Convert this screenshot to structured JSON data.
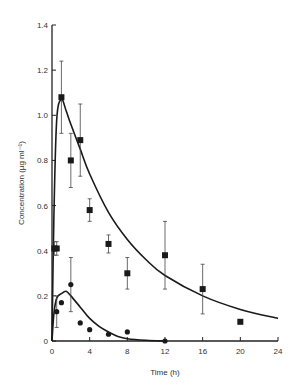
{
  "chart_data": {
    "type": "scatter",
    "title": "",
    "xlabel": "Time (h)",
    "ylabel": "Concentration (µg ml⁻¹)",
    "xlim": [
      0,
      24
    ],
    "ylim": [
      0,
      1.4
    ],
    "xticks": [
      0,
      4,
      8,
      12,
      16,
      20,
      24
    ],
    "yticks": [
      0,
      0.2,
      0.4,
      0.6,
      0.8,
      1.0,
      1.2,
      1.4
    ],
    "xtick_labels": [
      "0",
      "4",
      "8",
      "12",
      "16",
      "20",
      "24"
    ],
    "ytick_labels": [
      "0",
      "0.2",
      "0.4",
      "0.6",
      "0.8",
      "1.0",
      "1.2",
      "1.4"
    ],
    "grid": false,
    "legend": null,
    "series": [
      {
        "name": "squares",
        "marker": "square",
        "x": [
          0.25,
          0.5,
          1,
          2,
          3,
          4,
          6,
          8,
          12,
          16,
          20
        ],
        "y": [
          0.41,
          0.41,
          1.08,
          0.8,
          0.89,
          0.58,
          0.43,
          0.3,
          0.38,
          0.23,
          0.085
        ],
        "err": [
          0.03,
          0.03,
          0.16,
          0.12,
          0.16,
          0.05,
          0.04,
          0.07,
          0.15,
          0.11,
          0
        ],
        "fit_curve": {
          "x": [
            0,
            0.2,
            0.5,
            1,
            1.5,
            2,
            3,
            4,
            6,
            8,
            10,
            12,
            16,
            20,
            24
          ],
          "y": [
            0,
            0.55,
            0.98,
            1.07,
            1.02,
            0.96,
            0.85,
            0.74,
            0.57,
            0.45,
            0.36,
            0.29,
            0.2,
            0.14,
            0.1
          ]
        }
      },
      {
        "name": "circles",
        "marker": "circle",
        "x": [
          0.5,
          1,
          2,
          3,
          4,
          6,
          8,
          12
        ],
        "y": [
          0.13,
          0.17,
          0.25,
          0.08,
          0.05,
          0.03,
          0.04,
          0.0
        ],
        "err": [
          0.07,
          0,
          0.12,
          0,
          0,
          0,
          0,
          0
        ],
        "fit_curve": {
          "x": [
            0,
            0.2,
            0.5,
            1,
            1.5,
            2,
            3,
            4,
            5,
            6,
            7,
            8,
            10,
            12
          ],
          "y": [
            0,
            0.12,
            0.19,
            0.21,
            0.22,
            0.2,
            0.15,
            0.1,
            0.065,
            0.04,
            0.02,
            0.01,
            0.003,
            0.0
          ]
        }
      }
    ]
  }
}
